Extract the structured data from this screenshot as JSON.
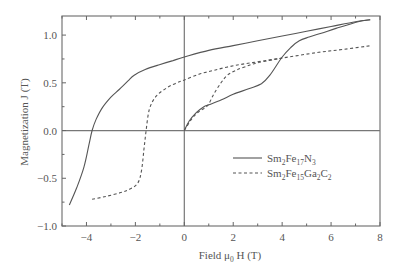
{
  "chart_data": {
    "type": "line",
    "title": "",
    "xlabel": "Field μ0 H (T)",
    "xlabel_parts": {
      "pre": "Field μ",
      "sub": "0",
      "post": " H (T)"
    },
    "ylabel": "Magnetization J (T)",
    "xlim": [
      -5,
      8
    ],
    "ylim": [
      -1.0,
      1.2
    ],
    "xticks": [
      -4,
      -2,
      0,
      2,
      4,
      6,
      8
    ],
    "xtick_labels": [
      "−4",
      "−2",
      "0",
      "2",
      "4",
      "6",
      "8"
    ],
    "xminor_step": 1,
    "yticks": [
      -1.0,
      -0.5,
      0.0,
      0.5,
      1.0
    ],
    "ytick_labels": [
      "−1.0",
      "−0.5",
      "0.0",
      "0.5",
      "1.0"
    ],
    "yminor_step": 0.25,
    "grid": false,
    "zero_lines": true,
    "legend_position": "center-right",
    "series": [
      {
        "name": "Sm2Fe17N3",
        "label_parts": [
          [
            "Sm",
            ""
          ],
          [
            "2",
            "sub"
          ],
          [
            "Fe",
            ""
          ],
          [
            "17",
            "sub"
          ],
          [
            "N",
            ""
          ],
          [
            "3",
            "sub"
          ]
        ],
        "style": "solid",
        "color": "#555555",
        "branches": [
          {
            "name": "demagnetization",
            "x": [
              -4.7,
              -4.4,
              -4.1,
              -3.9,
              -3.77,
              -3.6,
              -3.35,
              -3.0,
              -2.66,
              -2.3,
              -2.05,
              -1.6,
              -1.02,
              -0.5,
              0.0,
              1.0,
              2.0,
              3.0,
              4.0,
              5.0,
              6.0,
              7.0,
              7.6
            ],
            "y": [
              -0.78,
              -0.6,
              -0.38,
              -0.15,
              0.0,
              0.12,
              0.24,
              0.35,
              0.43,
              0.52,
              0.58,
              0.64,
              0.69,
              0.73,
              0.77,
              0.84,
              0.89,
              0.94,
              0.99,
              1.04,
              1.09,
              1.14,
              1.16
            ]
          },
          {
            "name": "virgin",
            "x": [
              0.0,
              0.2,
              0.5,
              0.8,
              1.0,
              1.5,
              2.0,
              2.66,
              3.15,
              3.5,
              4.0,
              4.4,
              4.7,
              5.1,
              5.6,
              6.2,
              7.1,
              7.6
            ],
            "y": [
              0.0,
              0.1,
              0.19,
              0.25,
              0.27,
              0.32,
              0.38,
              0.44,
              0.49,
              0.58,
              0.77,
              0.88,
              0.94,
              0.98,
              1.02,
              1.07,
              1.14,
              1.16
            ]
          }
        ]
      },
      {
        "name": "Sm2Fe15Ga2C2",
        "label_parts": [
          [
            "Sm",
            ""
          ],
          [
            "2",
            "sub"
          ],
          [
            "Fe",
            ""
          ],
          [
            "15",
            "sub"
          ],
          [
            "Ga",
            ""
          ],
          [
            "2",
            "sub"
          ],
          [
            "C",
            ""
          ],
          [
            "2",
            "sub"
          ]
        ],
        "style": "dashed",
        "color": "#555555",
        "branches": [
          {
            "name": "demagnetization",
            "x": [
              -3.77,
              -3.2,
              -2.6,
              -2.2,
              -1.9,
              -1.75,
              -1.65,
              -1.56,
              -1.43,
              -1.15,
              -0.7,
              -0.3,
              0.0,
              0.6,
              1.2,
              1.84,
              2.5,
              3.5,
              4.5,
              5.5,
              6.5,
              7.66
            ],
            "y": [
              -0.72,
              -0.69,
              -0.65,
              -0.61,
              -0.55,
              -0.42,
              -0.2,
              0.0,
              0.22,
              0.36,
              0.45,
              0.5,
              0.53,
              0.59,
              0.63,
              0.67,
              0.7,
              0.74,
              0.78,
              0.82,
              0.85,
              0.89
            ]
          },
          {
            "name": "virgin",
            "x": [
              0.0,
              0.3,
              0.6,
              0.95,
              1.2,
              1.5,
              1.76,
              2.1,
              2.5,
              3.0,
              4.0
            ],
            "y": [
              0.0,
              0.12,
              0.2,
              0.26,
              0.38,
              0.5,
              0.58,
              0.63,
              0.67,
              0.71,
              0.76
            ]
          }
        ]
      }
    ]
  },
  "plot_box": {
    "left": 62,
    "top": 16,
    "right": 380,
    "bottom": 226
  }
}
